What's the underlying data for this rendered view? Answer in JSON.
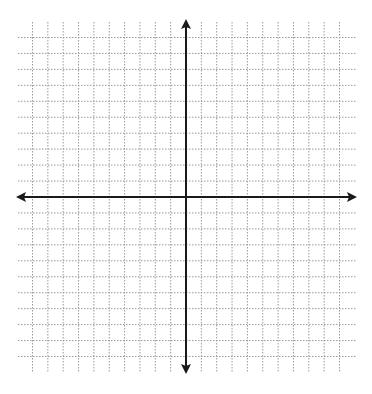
{
  "diagram": {
    "type": "coordinate-plane",
    "grid": {
      "x_min": -10,
      "x_max": 10,
      "y_min": -10,
      "y_max": 10,
      "line_style": "dotted",
      "line_color": "#9a9a9a"
    },
    "axes": {
      "color": "#1a1a1a",
      "x_axis_arrows": true,
      "y_axis_arrows": true,
      "labels": "none"
    }
  }
}
